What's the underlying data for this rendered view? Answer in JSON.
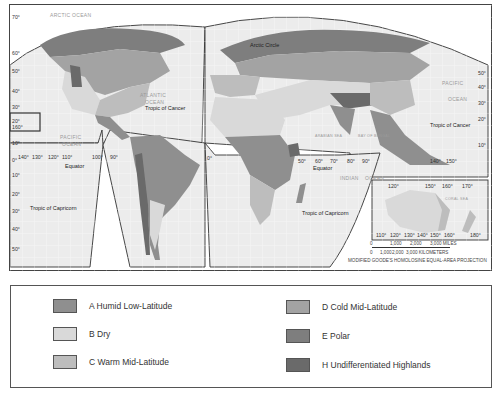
{
  "map": {
    "projection_note": "MODIFIED GOODE'S HOMOLOSINE EQUAL-AREA PROJECTION",
    "scale": {
      "miles_label": "3,000 MILES",
      "miles_ticks": [
        "0",
        "1,000",
        "2,000",
        "3,000 MILES"
      ],
      "km_ticks": [
        "0",
        "1,000",
        "2,000",
        "3,000 KILOMETERS"
      ]
    },
    "labels": {
      "arctic_circle": "Arctic Circle",
      "tropic_cancer_atlantic": "Tropic of Cancer",
      "tropic_cancer_pacific": "Tropic of Cancer",
      "tropic_capricorn_americas": "Tropic of Capricorn",
      "tropic_capricorn_indian": "Tropic of Capricorn",
      "equator_americas": "Equator",
      "equator_indian": "Equator"
    },
    "oceans": {
      "arctic": "ARCTIC OCEAN",
      "atlantic_1": "ATLANTIC",
      "atlantic_2": "OCEAN",
      "pacific_w1": "PACIFIC",
      "pacific_w2": "OCEAN",
      "pacific_e1": "PACIFIC",
      "pacific_e2": "OCEAN",
      "indian_1": "INDIAN",
      "indian_2": "OCEAN",
      "arabian_sea": "ARABIAN SEA",
      "bay_bengal": "BAY OF BENGAL",
      "coral_sea": "CORAL SEA"
    },
    "degree_labels": {
      "lat_left": [
        "70°",
        "60°",
        "50°",
        "40°",
        "30°",
        "20°",
        "10°",
        "0°",
        "10°",
        "20°",
        "30°",
        "40°",
        "50°"
      ],
      "lat_right": [
        "50°",
        "40°",
        "30°",
        "20°",
        "10°"
      ],
      "lon_americas": [
        "140°",
        "130°",
        "120°",
        "110°",
        "100°",
        "90°"
      ],
      "lon_indian": [
        "50°",
        "60°",
        "70°",
        "80°",
        "90°"
      ],
      "lon_pacific": [
        "140°",
        "150°"
      ],
      "lon_australia_top": [
        "120°",
        "150°",
        "160°",
        "170°"
      ],
      "lon_australia_bottom": [
        "110°",
        "120°",
        "130°",
        "140°",
        "150°",
        "160°",
        "180°"
      ],
      "hawaii_inset": "160°",
      "prime": "0°"
    },
    "colors": {
      "ocean": "#efefef",
      "A": "#8f8f8f",
      "B": "#d9d9d9",
      "C": "#bdbdbd",
      "D": "#a3a3a3",
      "E": "#7e7e7e",
      "H": "#6a6a6a"
    }
  },
  "legend": {
    "items": [
      {
        "code": "A",
        "label": "A  Humid Low-Latitude",
        "color": "#8f8f8f"
      },
      {
        "code": "B",
        "label": "B  Dry",
        "color": "#d9d9d9"
      },
      {
        "code": "C",
        "label": "C  Warm Mid-Latitude",
        "color": "#bdbdbd"
      },
      {
        "code": "D",
        "label": "D  Cold Mid-Latitude",
        "color": "#a3a3a3"
      },
      {
        "code": "E",
        "label": "E  Polar",
        "color": "#7e7e7e"
      },
      {
        "code": "H",
        "label": "H  Undifferentiated Highlands",
        "color": "#6a6a6a"
      }
    ]
  }
}
